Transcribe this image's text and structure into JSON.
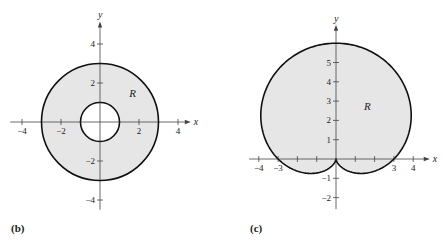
{
  "colors": {
    "region_fill": "#e6e6e6",
    "curve": "#111111",
    "axis": "#444444",
    "background": "#ffffff"
  },
  "panels": [
    {
      "id": "b",
      "label": "(b)",
      "label_pos": [
        11,
        222
      ],
      "origin_px": [
        100,
        122
      ],
      "unit_px": 19.5,
      "x_axis": {
        "label": "x",
        "range": [
          -4.6,
          4.4
        ],
        "ticks": [
          -4,
          -2,
          2,
          4
        ],
        "tick_labels": [
          "−4",
          "−2",
          "2",
          "4"
        ]
      },
      "y_axis": {
        "label": "y",
        "range": [
          -4.5,
          4.9
        ],
        "ticks": [
          4,
          2,
          -2,
          -4
        ],
        "tick_labels": [
          "4",
          "2",
          "−2",
          "−4"
        ]
      },
      "region_label": {
        "text": "R",
        "pos": [
          1.5,
          1.3
        ]
      },
      "shape": {
        "type": "annulus",
        "outer_r": 3,
        "inner_r": 1
      }
    },
    {
      "id": "c",
      "label": "(c)",
      "label_pos": [
        250,
        222
      ],
      "origin_px": [
        336,
        159
      ],
      "unit_px": 19.3,
      "x_axis": {
        "label": "x",
        "range": [
          -4.5,
          4.6
        ],
        "ticks": [
          -4,
          -3,
          -2,
          -1,
          1,
          2,
          3,
          4
        ],
        "tick_labels": [
          "−4",
          "−3",
          "",
          "",
          "",
          "",
          "3",
          "4"
        ]
      },
      "y_axis": {
        "label": "y",
        "range": [
          -2.6,
          6.7
        ],
        "ticks": [
          5,
          4,
          3,
          2,
          1,
          -1,
          -2
        ],
        "tick_labels": [
          "5",
          "4",
          "3",
          "2",
          "1",
          "−1",
          "−2"
        ]
      },
      "region_label": {
        "text": "R",
        "pos": [
          1.45,
          2.55
        ]
      },
      "shape": {
        "type": "cardioid",
        "equation": "r = 3 + 3 sin θ",
        "a": 3
      }
    }
  ]
}
